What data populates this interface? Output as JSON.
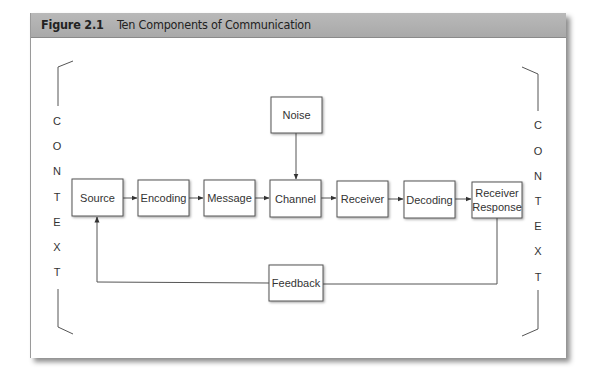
{
  "header": {
    "figure_number": "Figure 2.1",
    "title": "Ten Components of Communication"
  },
  "diagram": {
    "nodes": {
      "source": "Source",
      "encoding": "Encoding",
      "message": "Message",
      "channel": "Channel",
      "receiver": "Receiver",
      "decoding": "Decoding",
      "response_line1": "Receiver",
      "response_line2": "Response",
      "noise": "Noise",
      "feedback": "Feedback"
    },
    "context_left": [
      "C",
      "O",
      "N",
      "T",
      "E",
      "X",
      "T"
    ],
    "context_right": [
      "C",
      "O",
      "N",
      "T",
      "E",
      "X",
      "T"
    ],
    "flow": [
      "Source",
      "Encoding",
      "Message",
      "Channel",
      "Receiver",
      "Decoding",
      "Receiver Response"
    ],
    "noise_target": "Channel",
    "feedback_path": [
      "Receiver Response",
      "Feedback",
      "Source"
    ],
    "colors": {
      "header_bg": "#b0b0b0",
      "line": "#555555",
      "text": "#333333"
    }
  }
}
